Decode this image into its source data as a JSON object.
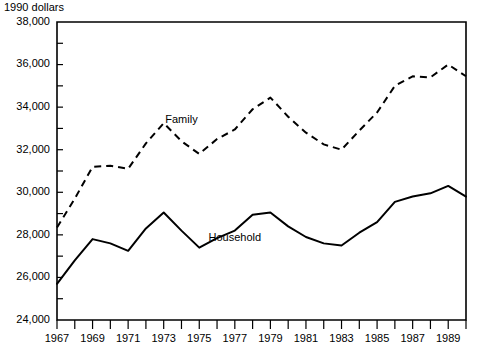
{
  "chart_data": {
    "type": "line",
    "title": "",
    "ylabel": "1990 dollars",
    "xlabel": "",
    "ylim": [
      24000,
      38000
    ],
    "ytick_step": 2000,
    "yminor_step": 1000,
    "grid": false,
    "legend_position": "inline-annotations",
    "yticks": [
      "24,000",
      "26,000",
      "28,000",
      "30,000",
      "32,000",
      "34,000",
      "36,000",
      "38,000"
    ],
    "ytick_values": [
      24000,
      26000,
      28000,
      30000,
      32000,
      34000,
      36000,
      38000
    ],
    "x": [
      1967,
      1968,
      1969,
      1970,
      1971,
      1972,
      1973,
      1974,
      1975,
      1976,
      1977,
      1978,
      1979,
      1980,
      1981,
      1982,
      1983,
      1984,
      1985,
      1986,
      1987,
      1988,
      1989,
      1990
    ],
    "xtick_labels": [
      "1967",
      "",
      "1969",
      "",
      "1971",
      "",
      "1973",
      "",
      "1975",
      "",
      "1977",
      "",
      "1979",
      "",
      "1981",
      "",
      "1983",
      "",
      "1985",
      "",
      "1987",
      "",
      "1989",
      ""
    ],
    "series": [
      {
        "name": "Family",
        "style": "dashed",
        "label_x": 1974,
        "label_y": 33250,
        "values": [
          28350,
          29700,
          31200,
          31250,
          31100,
          32300,
          33250,
          32400,
          31800,
          32500,
          32950,
          33900,
          34450,
          33550,
          32800,
          32250,
          32000,
          32900,
          33750,
          35000,
          35450,
          35400,
          36000,
          35450
        ]
      },
      {
        "name": "Household",
        "style": "solid",
        "label_x": 1977,
        "label_y": 27700,
        "values": [
          25700,
          26800,
          27800,
          27600,
          27250,
          28300,
          29050,
          28200,
          27400,
          27850,
          28200,
          28950,
          29050,
          28400,
          27900,
          27600,
          27500,
          28100,
          28600,
          29550,
          29800,
          29950,
          30300,
          29800
        ]
      }
    ]
  },
  "axis": {
    "y_axis_title": "1990 dollars"
  }
}
